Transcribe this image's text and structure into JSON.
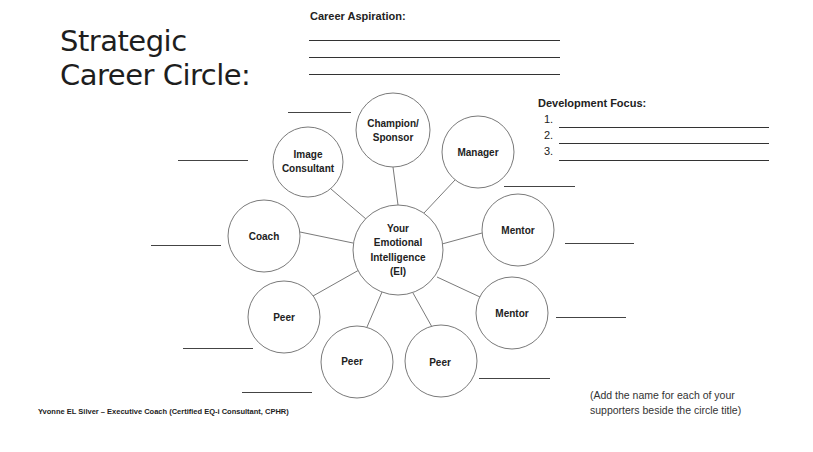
{
  "title": {
    "line1": "Strategic",
    "line2": "Career Circle:"
  },
  "career_aspiration": {
    "label": "Career Aspiration:",
    "blank_lines": 3
  },
  "development_focus": {
    "label": "Development Focus:",
    "items": [
      "1.",
      "2.",
      "3."
    ]
  },
  "diagram": {
    "center": {
      "lines": [
        "Your",
        "Emotional",
        "Intelligence",
        "(EI)"
      ]
    },
    "nodes": [
      {
        "id": "champion",
        "lines": [
          "Champion/",
          "Sponsor"
        ]
      },
      {
        "id": "image-consultant",
        "lines": [
          "Image",
          "Consultant"
        ]
      },
      {
        "id": "manager",
        "lines": [
          "Manager"
        ]
      },
      {
        "id": "coach",
        "lines": [
          "Coach"
        ]
      },
      {
        "id": "mentor-1",
        "lines": [
          "Mentor"
        ]
      },
      {
        "id": "peer-left",
        "lines": [
          "Peer"
        ]
      },
      {
        "id": "mentor-2",
        "lines": [
          "Mentor"
        ]
      },
      {
        "id": "peer-bottom-left",
        "lines": [
          "Peer"
        ]
      },
      {
        "id": "peer-bottom-right",
        "lines": [
          "Peer"
        ]
      }
    ],
    "stroke_color": "#7a7a7a"
  },
  "footer": {
    "credit": "Yvonne EL Silver – Executive Coach (Certified EQ-i Consultant, CPHR)"
  },
  "note": {
    "line1": "(Add the name for each of your",
    "line2": "supporters beside the circle title)"
  }
}
